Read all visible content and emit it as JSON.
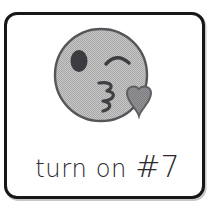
{
  "card": {
    "border_color": "#17171a",
    "background_color": "#ffffff",
    "caption": {
      "full_text": "turn on #7",
      "words": "turn on",
      "hash_number": "#7"
    },
    "emoji": {
      "name": "face-blowing-a-kiss",
      "description": "grayscale smiley face with winking eye and heart kiss",
      "face_fill": "#b8b8b8",
      "face_outline": "#4a4a4e",
      "eye_color": "#3b3b40",
      "heart_color": "#8a8a8a",
      "heart_outline": "#5e5e62",
      "mouth_color": "#3f3f44",
      "parts": {
        "left_eye": "open-oval-eye",
        "right_eye": "winking-arc-eye",
        "mouth": "puckered-lips",
        "accent": "heart"
      }
    }
  }
}
